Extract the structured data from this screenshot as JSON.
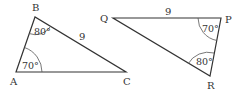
{
  "triangle_abc": {
    "vertices": {
      "A": "A",
      "B": "B",
      "C": "C"
    },
    "angle_b": "80°",
    "angle_a": "70°",
    "side_bc": "9"
  },
  "triangle_pqr": {
    "vertices": {
      "Q": "Q",
      "P": "P",
      "R": "R"
    },
    "angle_p": "70°",
    "angle_r": "80°",
    "side_qp": "9"
  },
  "colors": {
    "stroke": "#333333",
    "background": "#ffffff"
  }
}
